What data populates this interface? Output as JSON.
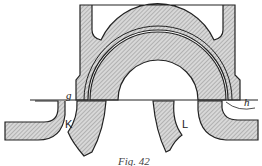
{
  "figure": {
    "caption": "Fig. 42",
    "labels": {
      "g": "g",
      "K": "K",
      "L": "L",
      "h": "h"
    },
    "colors": {
      "line": "#222222",
      "hatch": "#888888",
      "background": "#ffffff"
    }
  }
}
